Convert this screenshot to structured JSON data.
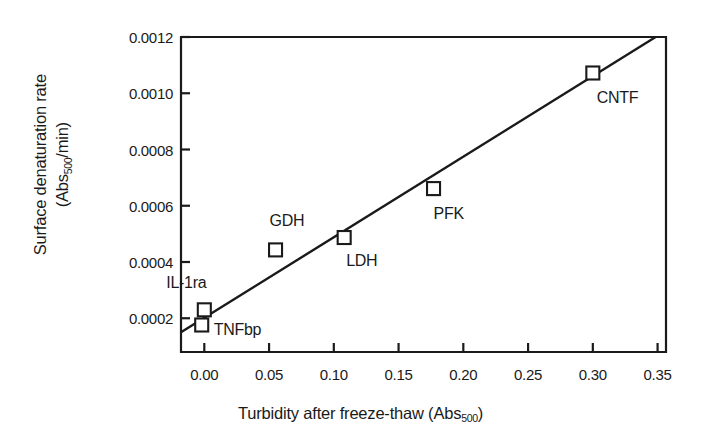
{
  "chart_data": {
    "type": "scatter",
    "title": "",
    "xlabel": "Turbidity after freeze-thaw (Abs500)",
    "xlabel_parts": {
      "main": "Turbidity after freeze-thaw (Abs",
      "sub": "500",
      "tail": ")"
    },
    "ylabel_line1": "Surface denaturation rate",
    "ylabel_line2_parts": {
      "main": "(Abs",
      "sub": "500",
      "tail": "/min)"
    },
    "ylabel": "Surface denaturation rate (Abs500/min)",
    "xlim": [
      -0.018,
      0.3565
    ],
    "ylim": [
      8e-05,
      0.0012
    ],
    "xticks": [
      0.0,
      0.05,
      0.1,
      0.15,
      0.2,
      0.25,
      0.3,
      0.35
    ],
    "xticklabels": [
      "0.00",
      "0.05",
      "0.10",
      "0.15",
      "0.20",
      "0.25",
      "0.30",
      "0.35"
    ],
    "yticks": [
      0.0002,
      0.0004,
      0.0006,
      0.0008,
      0.001,
      0.0012
    ],
    "yticklabels": [
      "0.0002",
      "0.0004",
      "0.0006",
      "0.0008",
      "0.0010",
      "0.0012"
    ],
    "grid": false,
    "legend": "none",
    "marker": "open-square",
    "points": [
      {
        "label": "IL-1ra",
        "x": 0.0,
        "y": 0.00023,
        "label_dx": -38,
        "label_dy": -26
      },
      {
        "label": "TNFbp",
        "x": -0.002,
        "y": 0.000176,
        "label_dx": 12,
        "label_dy": 6
      },
      {
        "label": "GDH",
        "x": 0.055,
        "y": 0.000443,
        "label_dx": -6,
        "label_dy": -28
      },
      {
        "label": "LDH",
        "x": 0.108,
        "y": 0.000487,
        "label_dx": 2,
        "label_dy": 24
      },
      {
        "label": "PFK",
        "x": 0.177,
        "y": 0.000661,
        "label_dx": 0,
        "label_dy": 26
      },
      {
        "label": "CNTF",
        "x": 0.3,
        "y": 0.001072,
        "label_dx": 4,
        "label_dy": 26
      }
    ],
    "fit_line": {
      "type": "linear-regression",
      "x_start": -0.018,
      "y_start": 0.00015,
      "x_end": 0.3485,
      "y_end": 0.0012
    },
    "colors": {
      "axis": "#1a1a1a",
      "marker": "#1a1a1a",
      "line": "#1a1a1a",
      "background": "#ffffff"
    }
  }
}
